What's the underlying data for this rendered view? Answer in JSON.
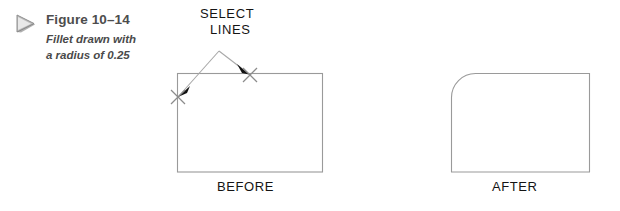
{
  "figure": {
    "marker_icon": "play-triangle-icon",
    "title": "Figure 10–14",
    "caption_line_1": "Fillet drawn with",
    "caption_line_2": "a radius of 0.25"
  },
  "annotations": {
    "select_lines_line_1": "SELECT",
    "select_lines_line_2": "LINES",
    "before_label": "BEFORE",
    "after_label": "AFTER"
  },
  "drawing": {
    "before_shape": {
      "name": "rectangle-sharp-corners",
      "x": 177,
      "y": 73,
      "width": 145,
      "height": 99,
      "corner_radius": 0
    },
    "after_shape": {
      "name": "rectangle-filleted-corner",
      "x": 451,
      "y": 73,
      "width": 139,
      "height": 99,
      "fillet_radius": 24,
      "filleted_corner": "top-left"
    },
    "leader": {
      "apex_x": 219,
      "apex_y": 51,
      "left_target_x": 178,
      "left_target_y": 97,
      "right_target_x": 248,
      "right_target_y": 74
    },
    "colors": {
      "outline": "#9a9a9a",
      "leader_line": "#a8a8a8",
      "arrowhead": "#111111",
      "x_mark": "#8c8c8c",
      "text": "#141414",
      "caption_text": "#4a4a4a",
      "background": "#ffffff"
    }
  }
}
